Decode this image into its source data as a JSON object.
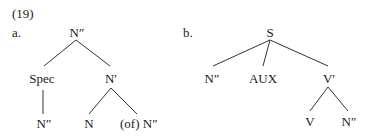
{
  "example_number": "(19)",
  "tree_a": {
    "label": "a.",
    "root": "N″",
    "level1": [
      "Spec",
      "N′"
    ],
    "spec_child": "N″",
    "nbar_children": [
      "N",
      "(of) N″"
    ]
  },
  "tree_b": {
    "label": "b.",
    "root": "S",
    "level1": [
      "N″",
      "AUX",
      "V′"
    ],
    "vbar_children": [
      "V",
      "N″"
    ]
  }
}
